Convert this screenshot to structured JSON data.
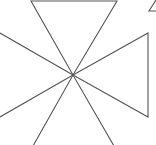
{
  "diagram": {
    "type": "pinwheel-triangles",
    "stroke_color": "#555555",
    "background": "#ffffff",
    "center": [
      73,
      75
    ],
    "shapes": [
      {
        "name": "top-triangle",
        "points": [
          [
            31,
            1
          ],
          [
            117,
            1
          ],
          [
            73,
            75
          ]
        ]
      },
      {
        "name": "right-triangle",
        "points": [
          [
            148,
            33
          ],
          [
            148,
            117
          ],
          [
            73,
            75
          ]
        ]
      },
      {
        "name": "left-triangle",
        "points": [
          [
            0,
            33
          ],
          [
            0,
            117
          ],
          [
            73,
            75
          ]
        ]
      },
      {
        "name": "bottom-triangle",
        "points": [
          [
            33,
            146
          ],
          [
            114,
            146
          ],
          [
            73,
            75
          ]
        ]
      },
      {
        "name": "corner-triangle-fragment",
        "points": [
          [
            149,
            11
          ],
          [
            156,
            11
          ],
          [
            156,
            0
          ]
        ]
      }
    ]
  }
}
